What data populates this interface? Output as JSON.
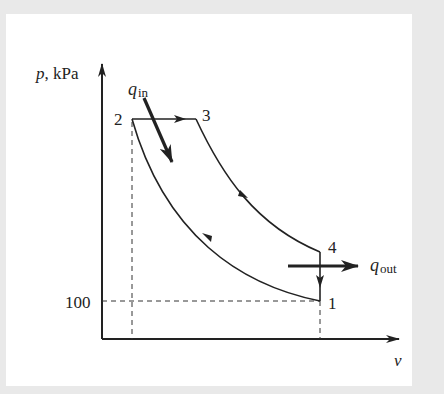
{
  "diagram": {
    "type": "p-v diagram (Otto cycle)",
    "y_axis_label_var": "p",
    "y_axis_label_unit": ", kPa",
    "x_axis_label": "v",
    "y_tick_label": "100",
    "states": [
      {
        "id": "1",
        "label": "1"
      },
      {
        "id": "2",
        "label": "2"
      },
      {
        "id": "3",
        "label": "3"
      },
      {
        "id": "4",
        "label": "4"
      }
    ],
    "heat_in": {
      "symbol": "q",
      "subscript": "in"
    },
    "heat_out": {
      "symbol": "q",
      "subscript": "out"
    },
    "colors": {
      "background": "#e9e9e9",
      "panel": "#ffffff",
      "ink": "#222222"
    }
  }
}
